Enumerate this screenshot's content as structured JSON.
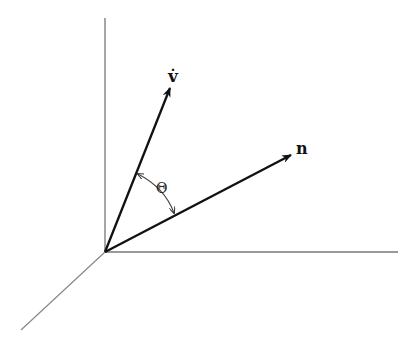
{
  "diagram": {
    "type": "vector-angle-3d",
    "origin": [
      105,
      252
    ],
    "axes": [
      {
        "name": "vertical-axis",
        "from": [
          105,
          252
        ],
        "to": [
          105,
          18
        ],
        "color": "#777777"
      },
      {
        "name": "horizontal-axis",
        "from": [
          105,
          252
        ],
        "to": [
          398,
          252
        ],
        "color": "#777777"
      },
      {
        "name": "depth-axis",
        "from": [
          105,
          252
        ],
        "to": [
          21,
          330
        ],
        "color": "#777777"
      }
    ],
    "vectors": [
      {
        "name": "v-dot",
        "label": "v̇",
        "from": [
          105,
          252
        ],
        "to": [
          170,
          88
        ],
        "label_pos": [
          173,
          80
        ]
      },
      {
        "name": "n",
        "label": "n",
        "from": [
          105,
          252
        ],
        "to": [
          291,
          155
        ],
        "label_pos": [
          296,
          153
        ]
      }
    ],
    "angle": {
      "label": "Θ",
      "label_pos": [
        161,
        186
      ]
    },
    "colors": {
      "vector": "#111111",
      "axis": "#777777",
      "arc": "#444444"
    }
  },
  "labels": {
    "v": "v̇",
    "n": "n",
    "theta": "Θ"
  }
}
